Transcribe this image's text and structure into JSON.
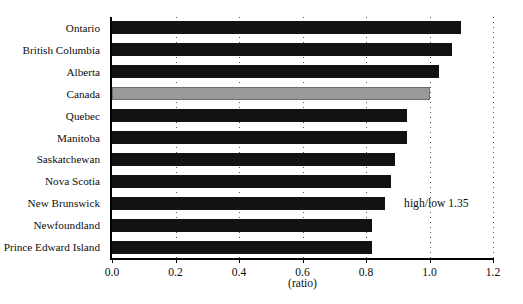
{
  "chart_data": {
    "type": "bar",
    "orientation": "horizontal",
    "title": "",
    "subtitle": "",
    "xlabel": "(ratio)",
    "ylabel": "",
    "xlim": [
      0.0,
      1.2
    ],
    "xticks": [
      "0.0",
      "0.2",
      "0.4",
      "0.6",
      "0.8",
      "1.0",
      "1.2"
    ],
    "xtick_values": [
      0.0,
      0.2,
      0.4,
      0.6,
      0.8,
      1.0,
      1.2
    ],
    "grid": "vertical-dotted",
    "legend": "none",
    "categories": [
      "Ontario",
      "British Columbia",
      "Alberta",
      "Canada",
      "Quebec",
      "Manitoba",
      "Saskatchewan",
      "Nova Scotia",
      "New Brunswick",
      "Newfoundland",
      "Prince Edward Island"
    ],
    "values": [
      1.1,
      1.07,
      1.03,
      1.0,
      0.93,
      0.93,
      0.89,
      0.88,
      0.86,
      0.82,
      0.82
    ],
    "highlight_category": "Canada",
    "colors": {
      "bar": "#121212",
      "highlight_bar": "#9a9a9a",
      "axis": "#000000",
      "gridline": "#555555",
      "text": "#0d0d0d"
    },
    "annotations": [
      {
        "text": "high/low 1.35",
        "x": 0.92,
        "category_index": 8
      }
    ]
  }
}
